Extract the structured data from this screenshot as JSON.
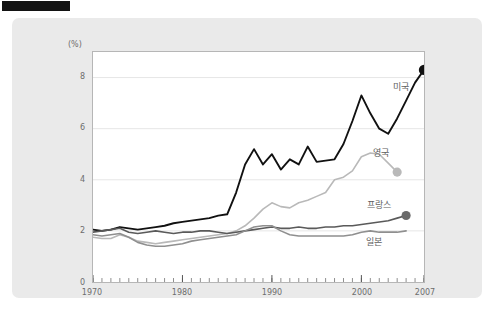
{
  "header": {
    "tab_label": "",
    "faint_text": ""
  },
  "chart_data": {
    "type": "line",
    "title": "",
    "subtitle": "",
    "xlabel": "",
    "ylabel": "",
    "unit_label": "(%)",
    "xlim": [
      1970,
      2007
    ],
    "ylim": [
      0,
      9
    ],
    "grid": true,
    "legend_position": "inline-end-of-line",
    "y_ticks": [
      "0",
      "2",
      "4",
      "6",
      "8"
    ],
    "y_tick_values": [
      0,
      2,
      4,
      6,
      8
    ],
    "x_ticks": [
      "1970",
      "1980",
      "1990",
      "2000",
      "2007"
    ],
    "x_tick_values": [
      1970,
      1980,
      1990,
      2000,
      2007
    ],
    "x_minor_tick_step": 1,
    "series": [
      {
        "name": "미국",
        "color": "#111111",
        "marker_color": "#111111",
        "label_anchor_x": 2003.4,
        "label_anchor_y": 7.55,
        "end_marker": true,
        "x": [
          1970,
          1971,
          1972,
          1973,
          1974,
          1975,
          1976,
          1977,
          1978,
          1979,
          1980,
          1981,
          1982,
          1983,
          1984,
          1985,
          1986,
          1987,
          1988,
          1989,
          1990,
          1991,
          1992,
          1993,
          1994,
          1995,
          1996,
          1997,
          1998,
          1999,
          2000,
          2001,
          2002,
          2003,
          2004,
          2005,
          2006,
          2007
        ],
        "y": [
          2.05,
          2.0,
          2.05,
          2.15,
          2.1,
          2.05,
          2.1,
          2.15,
          2.2,
          2.3,
          2.35,
          2.4,
          2.45,
          2.5,
          2.6,
          2.65,
          3.5,
          4.6,
          5.2,
          4.6,
          5.0,
          4.4,
          4.8,
          4.6,
          5.3,
          4.7,
          4.75,
          4.8,
          5.4,
          6.3,
          7.3,
          6.6,
          6.0,
          5.8,
          6.4,
          7.1,
          7.8,
          8.3
        ]
      },
      {
        "name": "영국",
        "color": "#b9b9b9",
        "marker_color": "#b9b9b9",
        "label_anchor_x": 2001.2,
        "label_anchor_y": 5.0,
        "end_marker": true,
        "x": [
          1970,
          1971,
          1972,
          1973,
          1974,
          1975,
          1976,
          1977,
          1978,
          1979,
          1980,
          1981,
          1982,
          1983,
          1984,
          1985,
          1986,
          1987,
          1988,
          1989,
          1990,
          1991,
          1992,
          1993,
          1994,
          1995,
          1996,
          1997,
          1998,
          1999,
          2000,
          2001,
          2002,
          2003,
          2004
        ],
        "y": [
          1.75,
          1.7,
          1.7,
          1.85,
          1.75,
          1.6,
          1.55,
          1.5,
          1.55,
          1.6,
          1.65,
          1.7,
          1.75,
          1.8,
          1.85,
          1.9,
          2.0,
          2.2,
          2.5,
          2.85,
          3.1,
          2.95,
          2.9,
          3.1,
          3.2,
          3.35,
          3.5,
          4.0,
          4.1,
          4.35,
          4.9,
          5.05,
          5.0,
          4.65,
          4.3
        ]
      },
      {
        "name": "프랑스",
        "color": "#5a5a5a",
        "marker_color": "#6b6b6b",
        "label_anchor_x": 2000.6,
        "label_anchor_y": 3.0,
        "end_marker": true,
        "x": [
          1970,
          1971,
          1972,
          1973,
          1974,
          1975,
          1976,
          1977,
          1978,
          1979,
          1980,
          1981,
          1982,
          1983,
          1984,
          1985,
          1986,
          1987,
          1988,
          1989,
          1990,
          1991,
          1992,
          1993,
          1994,
          1995,
          1996,
          1997,
          1998,
          1999,
          2000,
          2001,
          2002,
          2003,
          2004,
          2005
        ],
        "y": [
          1.95,
          2.0,
          2.05,
          2.1,
          1.95,
          1.9,
          1.95,
          2.0,
          1.95,
          1.9,
          1.95,
          1.95,
          2.0,
          2.0,
          1.95,
          1.9,
          1.95,
          2.0,
          2.05,
          2.1,
          2.15,
          2.1,
          2.1,
          2.15,
          2.1,
          2.1,
          2.15,
          2.15,
          2.2,
          2.2,
          2.25,
          2.3,
          2.35,
          2.4,
          2.5,
          2.6
        ]
      },
      {
        "name": "일본",
        "color": "#8f8f8f",
        "marker_color": "#8f8f8f",
        "label_anchor_x": 2000.4,
        "label_anchor_y": 1.55,
        "end_marker": false,
        "x": [
          1970,
          1971,
          1972,
          1973,
          1974,
          1975,
          1976,
          1977,
          1978,
          1979,
          1980,
          1981,
          1982,
          1983,
          1984,
          1985,
          1986,
          1987,
          1988,
          1989,
          1990,
          1991,
          1992,
          1993,
          1994,
          1995,
          1996,
          1997,
          1998,
          1999,
          2000,
          2001,
          2002,
          2003,
          2004,
          2005
        ],
        "y": [
          1.85,
          1.8,
          1.85,
          1.9,
          1.75,
          1.55,
          1.45,
          1.4,
          1.4,
          1.45,
          1.5,
          1.6,
          1.65,
          1.7,
          1.75,
          1.8,
          1.85,
          2.0,
          2.15,
          2.2,
          2.2,
          2.0,
          1.85,
          1.8,
          1.8,
          1.8,
          1.8,
          1.8,
          1.8,
          1.85,
          1.95,
          2.0,
          1.95,
          1.95,
          1.95,
          2.0
        ]
      }
    ]
  }
}
